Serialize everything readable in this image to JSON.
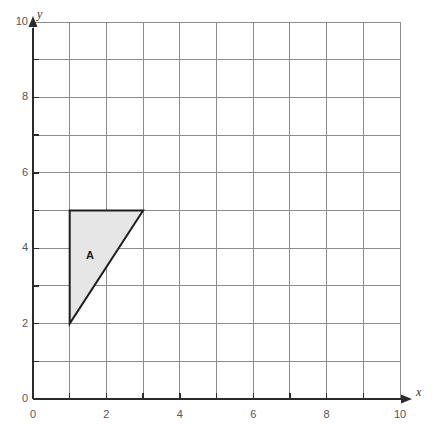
{
  "figure": {
    "kind": "coordinate-grid",
    "background_color": "#ffffff",
    "grid": {
      "x_min": 0,
      "x_max": 10,
      "y_min": 0,
      "y_max": 10,
      "step": 1,
      "grid_line_color": "#8c8c8c",
      "grid_visible": true
    },
    "axes": {
      "x_label": "x",
      "y_label": "y",
      "axis_color": "#2b2b2b",
      "tick_label_color": "#555555",
      "x_tick_labels": [
        "0",
        "2",
        "4",
        "6",
        "8",
        "10"
      ],
      "x_tick_values": [
        0,
        2,
        4,
        6,
        8,
        10
      ],
      "y_tick_labels": [
        "0",
        "2",
        "4",
        "6",
        "8",
        "10"
      ],
      "y_tick_values": [
        0,
        2,
        4,
        6,
        8,
        10
      ],
      "minor_tick_values": [
        1,
        3,
        5,
        7,
        9
      ],
      "arrowheads": true
    },
    "shapes": [
      {
        "name": "A",
        "label": "A",
        "type": "triangle",
        "vertices": [
          [
            1,
            5
          ],
          [
            3,
            5
          ],
          [
            1,
            2
          ]
        ],
        "fill_color": "#e6e6e6",
        "stroke_color": "#1f1f1f",
        "stroke_width": 2,
        "label_position": [
          1.55,
          3.8
        ]
      }
    ]
  }
}
